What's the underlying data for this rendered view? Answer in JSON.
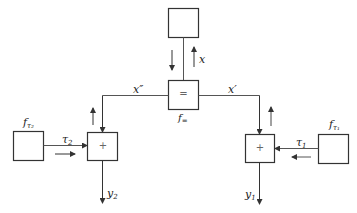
{
  "diagram": {
    "type": "factor-graph",
    "nodes": {
      "top_box": {
        "label": ""
      },
      "equality_node": {
        "symbol": "=",
        "caption": "f",
        "caption_sub": "="
      },
      "left_plus": {
        "symbol": "+"
      },
      "right_plus": {
        "symbol": "+"
      },
      "left_factor": {
        "caption": "f",
        "caption_sub": "τ₂"
      },
      "right_factor": {
        "caption": "f",
        "caption_sub": "τ₁"
      }
    },
    "edges": {
      "x": {
        "label": "x"
      },
      "x_double_prime": {
        "label": "x″"
      },
      "x_prime": {
        "label": "x′"
      },
      "tau2": {
        "label": "τ",
        "sub": "2"
      },
      "tau1": {
        "label": "τ",
        "sub": "1"
      },
      "y2": {
        "label": "y",
        "sub": "2"
      },
      "y1": {
        "label": "y",
        "sub": "1"
      }
    },
    "colors": {
      "stroke": "#333333",
      "background": "#ffffff"
    }
  }
}
